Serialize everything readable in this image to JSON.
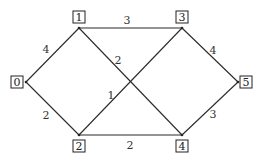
{
  "graph": {
    "type": "weighted undirected graph",
    "nodes": [
      {
        "id": "0",
        "label": "0",
        "x": 26,
        "y": 82,
        "lx": 17,
        "ly": 82
      },
      {
        "id": "1",
        "label": "1",
        "x": 79,
        "y": 28,
        "lx": 79,
        "ly": 17
      },
      {
        "id": "2",
        "label": "2",
        "x": 79,
        "y": 135,
        "lx": 79,
        "ly": 146
      },
      {
        "id": "3",
        "label": "3",
        "x": 182,
        "y": 28,
        "lx": 182,
        "ly": 17
      },
      {
        "id": "4",
        "label": "4",
        "x": 182,
        "y": 135,
        "lx": 182,
        "ly": 146
      },
      {
        "id": "5",
        "label": "5",
        "x": 238,
        "y": 82,
        "lx": 246,
        "ly": 82
      }
    ],
    "edges": [
      {
        "from": "0",
        "to": "1",
        "weight": "4",
        "wx": 46,
        "wy": 49
      },
      {
        "from": "0",
        "to": "2",
        "weight": "2",
        "wx": 46,
        "wy": 115
      },
      {
        "from": "1",
        "to": "3",
        "weight": "3",
        "wx": 127,
        "wy": 20
      },
      {
        "from": "1",
        "to": "4",
        "weight": "2",
        "wx": 118,
        "wy": 60
      },
      {
        "from": "2",
        "to": "3",
        "weight": "1",
        "wx": 111,
        "wy": 95
      },
      {
        "from": "2",
        "to": "4",
        "weight": "2",
        "wx": 130,
        "wy": 145
      },
      {
        "from": "3",
        "to": "5",
        "weight": "4",
        "wx": 213,
        "wy": 50
      },
      {
        "from": "4",
        "to": "5",
        "weight": "3",
        "wx": 213,
        "wy": 114
      }
    ]
  }
}
